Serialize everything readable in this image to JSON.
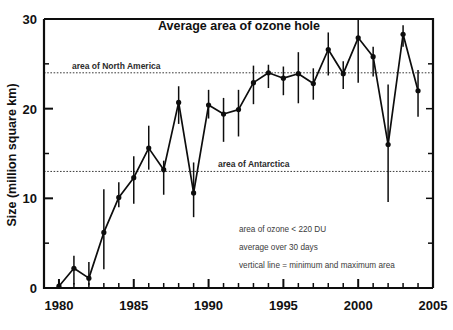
{
  "chart_data": {
    "type": "line",
    "title": "Average area of ozone hole",
    "xlabel": "",
    "ylabel": "Size (million square km)",
    "xlim": [
      1979,
      2005
    ],
    "ylim": [
      0,
      30
    ],
    "grid": false,
    "legend_position": "none",
    "x_major_ticks": [
      1980,
      1985,
      1990,
      1995,
      2000,
      2005
    ],
    "x_tick_labels": [
      "1980",
      "1985",
      "1990",
      "1995",
      "2000",
      "2005"
    ],
    "x_minor_step": 1,
    "y_major_ticks": [
      0,
      10,
      20,
      30
    ],
    "y_tick_labels": [
      "0",
      "10",
      "20",
      "30"
    ],
    "y_minor_ticks": [
      5,
      15,
      25
    ],
    "x": [
      1980,
      1981,
      1982,
      1983,
      1984,
      1985,
      1986,
      1987,
      1988,
      1989,
      1990,
      1991,
      1992,
      1993,
      1994,
      1995,
      1996,
      1997,
      1998,
      1999,
      2000,
      2001,
      2002,
      2003,
      2004
    ],
    "values": [
      0.2,
      2.2,
      1.1,
      6.2,
      10.1,
      12.3,
      15.6,
      13.2,
      20.7,
      10.6,
      20.4,
      19.4,
      19.9,
      22.9,
      24.0,
      23.4,
      23.9,
      22.8,
      26.6,
      23.9,
      27.9,
      25.8,
      16.0,
      28.3,
      22.0
    ],
    "error_low": [
      0.0,
      0.4,
      0.3,
      2.1,
      9.0,
      9.4,
      13.2,
      10.4,
      18.3,
      7.9,
      18.9,
      16.3,
      16.9,
      20.5,
      22.3,
      21.5,
      20.6,
      21.0,
      23.7,
      22.2,
      22.9,
      23.6,
      9.6,
      26.9,
      19.1
    ],
    "error_high": [
      0.8,
      3.6,
      2.9,
      11.0,
      11.8,
      14.7,
      18.1,
      14.2,
      22.5,
      14.0,
      22.1,
      21.2,
      22.1,
      24.8,
      24.9,
      24.7,
      26.3,
      24.5,
      28.5,
      25.3,
      30.0,
      26.9,
      22.7,
      29.3,
      24.3
    ],
    "reference_lines": [
      {
        "label": "area of North America",
        "value": 24.0
      },
      {
        "label": "area of Antarctica",
        "value": 13.0
      }
    ],
    "annotations": [
      "area of ozone < 220 DU",
      "average over 30 days",
      "vertical line = minimum and maximum area"
    ],
    "colors": {
      "line": "#0d0d0d",
      "marker": "#0d0d0d",
      "reference_line": "#3a3a3a",
      "axis": "#0d0d0d",
      "background": "#ffffff"
    }
  }
}
